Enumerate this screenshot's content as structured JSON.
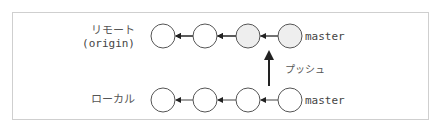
{
  "diagram": {
    "remote": {
      "label_line1": "リモート",
      "label_line2": "(origin)",
      "branch": "master",
      "commits": [
        {
          "filled": false
        },
        {
          "filled": false
        },
        {
          "filled": true
        },
        {
          "filled": true
        }
      ]
    },
    "local": {
      "label": "ローカル",
      "branch": "master",
      "commits": [
        {
          "filled": false
        },
        {
          "filled": false
        },
        {
          "filled": false
        },
        {
          "filled": false
        }
      ]
    },
    "push": {
      "label": "プッシュ",
      "direction": "up"
    },
    "colors": {
      "frame": "#cfcfcf",
      "circle_stroke": "#555555",
      "circle_fill_new": "#eeeeee",
      "arrow": "#222222"
    }
  }
}
